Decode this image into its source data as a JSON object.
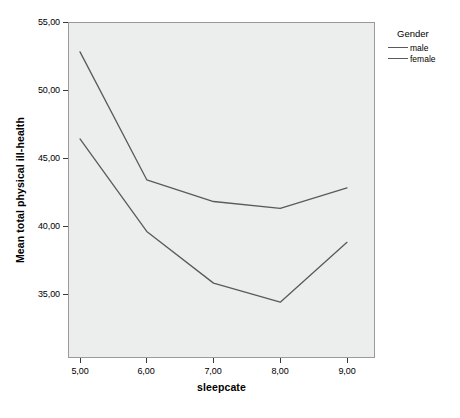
{
  "chart_data": {
    "type": "line",
    "title": "",
    "xlabel": "sleepcate",
    "ylabel": "Mean total physical ill-health",
    "x": [
      "5,00",
      "6,00",
      "7,00",
      "8,00",
      "9,00"
    ],
    "x_values": [
      5,
      6,
      7,
      8,
      9
    ],
    "xtick_labels": [
      "5,00",
      "6,00",
      "7,00",
      "8,00",
      "9,00"
    ],
    "ytick_labels": [
      "35,00",
      "40,00",
      "45,00",
      "50,00",
      "55,00"
    ],
    "ytick_values": [
      35,
      40,
      45,
      50,
      55
    ],
    "ylim": [
      33.0,
      55.0
    ],
    "xlim": [
      4.55,
      9.45
    ],
    "grid": false,
    "legend_position": "right",
    "legend_title": "Gender",
    "series": [
      {
        "name": "female",
        "color": "#5a5a5a",
        "values": [
          52.8,
          43.4,
          41.8,
          41.3,
          42.8
        ]
      },
      {
        "name": "male",
        "color": "#5a5a5a",
        "values": [
          46.4,
          39.6,
          35.8,
          34.4,
          38.8
        ]
      }
    ],
    "plot_background": "#eceded",
    "frame_color": "#9a9a9a"
  },
  "legend": {
    "title": "Gender",
    "entries": [
      {
        "label": "male"
      },
      {
        "label": "female"
      }
    ]
  }
}
